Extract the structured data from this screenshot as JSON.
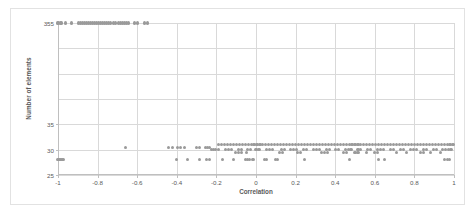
{
  "chart_data": {
    "type": "scatter",
    "title": "",
    "xlabel": "Correlation",
    "ylabel": "Number of elements",
    "xlim": [
      -1,
      1
    ],
    "ylim": [
      25,
      355
    ],
    "grid": true,
    "legend": false,
    "marker_color": "#9a9a9a",
    "gridline_color": "#d9d9d9",
    "axis_color": "#bfbfbf",
    "text_color": "#595959",
    "xticks": [
      "-1",
      "-0.8",
      "-0.6",
      "-0.4",
      "-0.2",
      "0",
      "0.2",
      "0.4",
      "0.6",
      "0.8",
      "1"
    ],
    "xtick_values": [
      -1,
      -0.8,
      -0.6,
      -0.4,
      -0.2,
      0,
      0.2,
      0.4,
      0.6,
      0.8,
      1
    ],
    "yticks": [
      "355",
      "35",
      "30",
      "25"
    ],
    "ytick_values": [
      355,
      35,
      30,
      25
    ],
    "ytick_positions": [
      0,
      0.6666,
      0.8333,
      1.0
    ],
    "hgrid_positions": [
      0,
      0.1666,
      0.3333,
      0.5,
      0.6666,
      0.8333,
      1.0
    ],
    "series": [
      {
        "name": "elements",
        "points": [
          [
            -1.0,
            355
          ],
          [
            -0.985,
            355
          ],
          [
            -0.96,
            355
          ],
          [
            -0.93,
            355
          ],
          [
            -0.895,
            355
          ],
          [
            -0.885,
            355
          ],
          [
            -0.875,
            355
          ],
          [
            -0.865,
            355
          ],
          [
            -0.855,
            355
          ],
          [
            -0.845,
            355
          ],
          [
            -0.835,
            355
          ],
          [
            -0.825,
            355
          ],
          [
            -0.815,
            355
          ],
          [
            -0.805,
            355
          ],
          [
            -0.795,
            355
          ],
          [
            -0.785,
            355
          ],
          [
            -0.775,
            355
          ],
          [
            -0.765,
            355
          ],
          [
            -0.755,
            355
          ],
          [
            -0.745,
            355
          ],
          [
            -0.735,
            355
          ],
          [
            -0.72,
            355
          ],
          [
            -0.71,
            355
          ],
          [
            -0.695,
            355
          ],
          [
            -0.685,
            355
          ],
          [
            -0.675,
            355
          ],
          [
            -0.665,
            355
          ],
          [
            -0.655,
            355
          ],
          [
            -0.645,
            355
          ],
          [
            -0.615,
            355
          ],
          [
            -0.6,
            355
          ],
          [
            -0.565,
            355
          ],
          [
            -0.55,
            355
          ],
          [
            -1.0,
            28
          ],
          [
            -0.99,
            28
          ],
          [
            -0.98,
            28
          ],
          [
            -0.97,
            28
          ],
          [
            -0.66,
            30.5
          ],
          [
            -0.44,
            30.5
          ],
          [
            -0.42,
            30.5
          ],
          [
            -0.395,
            30.5
          ],
          [
            -0.38,
            30.5
          ],
          [
            -0.36,
            30.5
          ],
          [
            -0.3,
            30.5
          ],
          [
            -0.285,
            30.5
          ],
          [
            -0.255,
            30.5
          ],
          [
            -0.245,
            30.5
          ],
          [
            -0.235,
            30.5
          ],
          [
            -0.225,
            30.0
          ],
          [
            -0.215,
            30.0
          ],
          [
            -0.205,
            30.0
          ],
          [
            -0.19,
            30.0
          ],
          [
            -0.4,
            28
          ],
          [
            -0.345,
            28
          ],
          [
            -0.285,
            28
          ],
          [
            -0.25,
            28
          ],
          [
            -0.235,
            28
          ],
          [
            -0.17,
            28
          ],
          [
            -0.115,
            28
          ],
          [
            -0.055,
            28
          ],
          [
            -0.045,
            28
          ],
          [
            -0.035,
            28
          ],
          [
            -0.015,
            28
          ],
          [
            0.045,
            28
          ],
          [
            0.055,
            28
          ],
          [
            0.1,
            28
          ],
          [
            0.11,
            28
          ],
          [
            0.245,
            28
          ],
          [
            0.47,
            28
          ],
          [
            0.62,
            28
          ],
          [
            0.65,
            28
          ],
          [
            0.95,
            28
          ],
          [
            0.965,
            28
          ],
          [
            0.975,
            28
          ],
          [
            -0.19,
            31
          ],
          [
            -0.175,
            31
          ],
          [
            -0.16,
            31
          ],
          [
            -0.145,
            31
          ],
          [
            -0.13,
            31
          ],
          [
            -0.115,
            31
          ],
          [
            -0.1,
            31
          ],
          [
            -0.085,
            31
          ],
          [
            -0.07,
            31
          ],
          [
            -0.055,
            31
          ],
          [
            -0.04,
            31
          ],
          [
            -0.025,
            31
          ],
          [
            -0.01,
            31
          ],
          [
            0.005,
            31
          ],
          [
            0.02,
            31
          ],
          [
            0.035,
            31
          ],
          [
            0.05,
            31
          ],
          [
            0.065,
            31
          ],
          [
            0.08,
            31
          ],
          [
            0.095,
            31
          ],
          [
            0.11,
            31
          ],
          [
            0.125,
            31
          ],
          [
            0.14,
            31
          ],
          [
            0.155,
            31
          ],
          [
            0.17,
            31
          ],
          [
            0.185,
            31
          ],
          [
            0.2,
            31
          ],
          [
            0.215,
            31
          ],
          [
            0.23,
            31
          ],
          [
            0.245,
            31
          ],
          [
            0.26,
            31
          ],
          [
            0.275,
            31
          ],
          [
            0.29,
            31
          ],
          [
            0.305,
            31
          ],
          [
            0.32,
            31
          ],
          [
            0.335,
            31
          ],
          [
            0.35,
            31
          ],
          [
            0.365,
            31
          ],
          [
            0.38,
            31
          ],
          [
            0.395,
            31
          ],
          [
            0.41,
            31
          ],
          [
            0.425,
            31
          ],
          [
            0.44,
            31
          ],
          [
            0.455,
            31
          ],
          [
            0.47,
            31
          ],
          [
            0.485,
            31
          ],
          [
            0.5,
            31
          ],
          [
            0.515,
            31
          ],
          [
            0.53,
            31
          ],
          [
            0.545,
            31
          ],
          [
            0.56,
            31
          ],
          [
            0.575,
            31
          ],
          [
            0.59,
            31
          ],
          [
            0.605,
            31
          ],
          [
            0.62,
            31
          ],
          [
            0.635,
            31
          ],
          [
            0.65,
            31
          ],
          [
            0.665,
            31
          ],
          [
            0.68,
            31
          ],
          [
            0.695,
            31
          ],
          [
            0.71,
            31
          ],
          [
            0.725,
            31
          ],
          [
            0.74,
            31
          ],
          [
            0.755,
            31
          ],
          [
            0.77,
            31
          ],
          [
            0.785,
            31
          ],
          [
            0.8,
            31
          ],
          [
            0.815,
            31
          ],
          [
            0.83,
            31
          ],
          [
            0.845,
            31
          ],
          [
            0.86,
            31
          ],
          [
            0.875,
            31
          ],
          [
            0.89,
            31
          ],
          [
            0.905,
            31
          ],
          [
            0.92,
            31
          ],
          [
            0.935,
            31
          ],
          [
            0.95,
            31
          ],
          [
            0.965,
            31
          ],
          [
            0.98,
            31
          ],
          [
            0.995,
            31
          ],
          [
            -0.155,
            30.0
          ],
          [
            -0.14,
            30.0
          ],
          [
            -0.125,
            30.0
          ],
          [
            -0.09,
            30.0
          ],
          [
            -0.075,
            30.0
          ],
          [
            -0.045,
            30.0
          ],
          [
            -0.03,
            30.0
          ],
          [
            0.0,
            30.0
          ],
          [
            0.015,
            30.0
          ],
          [
            0.055,
            30.0
          ],
          [
            0.07,
            30.0
          ],
          [
            0.085,
            30.0
          ],
          [
            0.13,
            30.0
          ],
          [
            0.145,
            30.0
          ],
          [
            0.175,
            30.0
          ],
          [
            0.19,
            30.0
          ],
          [
            0.205,
            30.0
          ],
          [
            0.24,
            30.0
          ],
          [
            0.255,
            30.0
          ],
          [
            0.29,
            30.0
          ],
          [
            0.305,
            30.0
          ],
          [
            0.32,
            30.0
          ],
          [
            0.355,
            30.0
          ],
          [
            0.37,
            30.0
          ],
          [
            0.4,
            30.0
          ],
          [
            0.415,
            30.0
          ],
          [
            0.45,
            30.0
          ],
          [
            0.465,
            30.0
          ],
          [
            0.48,
            30.0
          ],
          [
            0.515,
            30.0
          ],
          [
            0.53,
            30.0
          ],
          [
            0.565,
            30.0
          ],
          [
            0.58,
            30.0
          ],
          [
            0.615,
            30.0
          ],
          [
            0.63,
            30.0
          ],
          [
            0.645,
            30.0
          ],
          [
            0.68,
            30.0
          ],
          [
            0.695,
            30.0
          ],
          [
            0.73,
            30.0
          ],
          [
            0.745,
            30.0
          ],
          [
            0.78,
            30.0
          ],
          [
            0.795,
            30.0
          ],
          [
            0.81,
            30.0
          ],
          [
            0.845,
            30.0
          ],
          [
            0.86,
            30.0
          ],
          [
            0.895,
            30.0
          ],
          [
            0.91,
            30.0
          ],
          [
            0.94,
            30.0
          ],
          [
            0.955,
            30.0
          ],
          [
            0.97,
            30.0
          ],
          [
            0.985,
            30.0
          ],
          [
            -0.105,
            29.5
          ],
          [
            -0.09,
            29.5
          ],
          [
            -0.075,
            29.5
          ],
          [
            -0.05,
            29.5
          ],
          [
            0.12,
            29.5
          ],
          [
            0.135,
            29.5
          ],
          [
            0.21,
            29.5
          ],
          [
            0.225,
            29.5
          ],
          [
            0.33,
            29.5
          ],
          [
            0.345,
            29.5
          ],
          [
            0.36,
            29.5
          ],
          [
            0.44,
            29.5
          ],
          [
            0.455,
            29.5
          ],
          [
            0.5,
            29.5
          ],
          [
            0.515,
            29.5
          ],
          [
            0.56,
            29.5
          ],
          [
            0.6,
            29.5
          ],
          [
            0.615,
            29.5
          ],
          [
            0.71,
            29.5
          ],
          [
            0.76,
            29.5
          ],
          [
            0.83,
            29.5
          ],
          [
            0.845,
            29.5
          ],
          [
            0.88,
            29.5
          ],
          [
            0.93,
            29.5
          ]
        ]
      }
    ]
  }
}
